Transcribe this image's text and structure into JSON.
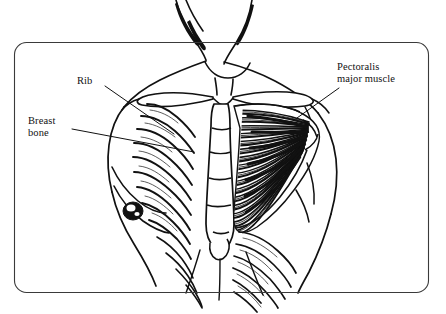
{
  "figure": {
    "name": "chest-anatomy-diagram",
    "background_color": "#ffffff",
    "ink_color": "#111111",
    "frame": {
      "name": "diagram-border",
      "x": 14,
      "y": 42,
      "width": 415,
      "height": 251,
      "corner_radius": 12,
      "stroke_color": "#333333",
      "stroke_width": 1
    }
  },
  "labels": [
    {
      "id": "rib",
      "name": "label-rib",
      "lines": [
        "Rib"
      ],
      "text": "Rib",
      "x": 77,
      "y": 75,
      "leader": {
        "x1": 105,
        "y1": 86,
        "x2": 174,
        "y2": 134
      }
    },
    {
      "id": "breast-bone",
      "name": "label-breast-bone",
      "lines": [
        "Breast",
        "bone"
      ],
      "line1": "Breast",
      "line2": "bone",
      "text": "Breast bone",
      "x": 28,
      "y": 115,
      "leader": {
        "x1": 72,
        "y1": 129,
        "x2": 194,
        "y2": 152
      }
    },
    {
      "id": "pectoralis-major-muscle",
      "name": "label-pectoralis-major-muscle",
      "lines": [
        "Pectoralis",
        "major muscle"
      ],
      "line1": "Pectoralis",
      "line2": "major muscle",
      "text": "Pectoralis major muscle",
      "x": 337,
      "y": 61,
      "leader": {
        "x1": 339,
        "y1": 88,
        "x2": 297,
        "y2": 118
      }
    }
  ],
  "anatomy": {
    "parts": [
      {
        "id": "neck",
        "name": "neck-outline",
        "label": "Neck"
      },
      {
        "id": "clavicle-left",
        "name": "clavicle-left",
        "label": "Left clavicle"
      },
      {
        "id": "clavicle-right",
        "name": "clavicle-right",
        "label": "Right clavicle"
      },
      {
        "id": "sternum",
        "name": "sternum-shape",
        "label": "Breast bone (sternum)"
      },
      {
        "id": "ribcage-left",
        "name": "ribcage-left",
        "label": "Ribs, left side",
        "rib_count": 8
      },
      {
        "id": "ribcage-lower-right",
        "name": "ribcage-lower-right",
        "label": "Ribs, lower right side",
        "rib_count": 6
      },
      {
        "id": "pectoralis",
        "name": "pectoralis-major-muscle-shape",
        "label": "Pectoralis major muscle",
        "fiber_count": 64
      },
      {
        "id": "breast",
        "name": "breast-outline",
        "label": "Breast"
      },
      {
        "id": "nipple",
        "name": "nipple-marking",
        "label": "Nipple"
      },
      {
        "id": "shoulder",
        "name": "shoulder-outline",
        "label": "Shoulder"
      },
      {
        "id": "arm",
        "name": "upper-arm-outline",
        "label": "Upper arm"
      },
      {
        "id": "torso",
        "name": "torso-outline",
        "label": "Torso"
      }
    ]
  }
}
